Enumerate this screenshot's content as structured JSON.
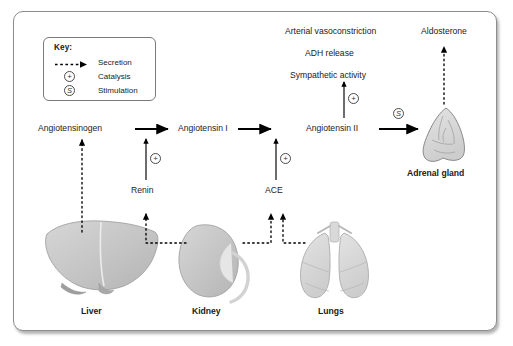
{
  "diagram": {
    "key": {
      "heading": "Key:",
      "items": [
        {
          "symbol": "dashed-arrow",
          "label": "Secretion"
        },
        {
          "symbol": "circle-plus",
          "label": "Catalysis"
        },
        {
          "symbol": "circle-s",
          "label": "Stimulation"
        }
      ]
    },
    "pathway": {
      "substrates": [
        {
          "id": "angiotensinogen",
          "label": "Angiotensinogen"
        },
        {
          "id": "angiotensin_i",
          "label": "Angiotensin I"
        },
        {
          "id": "angiotensin_ii",
          "label": "Angiotensin II"
        }
      ],
      "enzymes": [
        {
          "id": "renin",
          "label": "Renin",
          "catalysis_symbol": "+"
        },
        {
          "id": "ace",
          "label": "ACE",
          "catalysis_symbol": "+"
        }
      ]
    },
    "effects": {
      "catalysis_symbol": "+",
      "lines": [
        "Arterial vasoconstriction",
        "ADH release",
        "Sympathetic activity"
      ]
    },
    "hormone": {
      "label": "Aldosterone"
    },
    "stimulation_symbol": "S",
    "organs": [
      {
        "id": "liver",
        "label": "Liver"
      },
      {
        "id": "kidney",
        "label": "Kidney"
      },
      {
        "id": "lungs",
        "label": "Lungs"
      },
      {
        "id": "adrenal_gland",
        "label": "Adrenal gland"
      }
    ],
    "colors": {
      "frame_border": "#8d8d8d",
      "text": "#1a1a1a",
      "arrow": "#000000",
      "organ_fill": "#c8c8c8",
      "organ_stroke": "#8a8a8a"
    }
  }
}
